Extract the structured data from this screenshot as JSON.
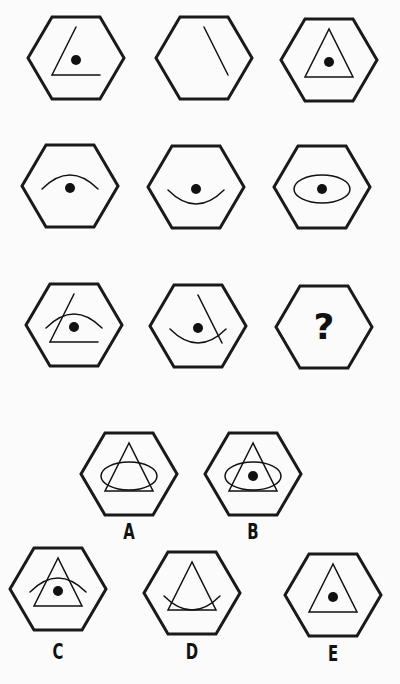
{
  "puzzle": {
    "header_partial_text": "",
    "question_mark": "?",
    "hexagon": {
      "half_width": 48,
      "half_height": 41,
      "stroke": "#1a1a1a",
      "stroke_width": 3
    },
    "colors": {
      "background": "#fbfbfb",
      "ink": "#111111"
    },
    "grid": [
      {
        "id": "r1c1",
        "cx": 76,
        "cy": 58,
        "elements": [
          "left-line",
          "base-line",
          "dot"
        ]
      },
      {
        "id": "r1c2",
        "cx": 204,
        "cy": 58,
        "elements": [
          "right-line"
        ]
      },
      {
        "id": "r1c3",
        "cx": 329,
        "cy": 60,
        "elements": [
          "triangle",
          "dot"
        ]
      },
      {
        "id": "r2c1",
        "cx": 70,
        "cy": 186,
        "elements": [
          "top-arc",
          "dot"
        ]
      },
      {
        "id": "r2c2",
        "cx": 196,
        "cy": 187,
        "elements": [
          "bottom-arc",
          "dot"
        ]
      },
      {
        "id": "r2c3",
        "cx": 322,
        "cy": 187,
        "elements": [
          "ellipse",
          "dot"
        ]
      },
      {
        "id": "r3c1",
        "cx": 74,
        "cy": 325,
        "elements": [
          "left-line",
          "base-line",
          "top-arc",
          "dot"
        ]
      },
      {
        "id": "r3c2",
        "cx": 198,
        "cy": 326,
        "elements": [
          "right-line",
          "bottom-arc",
          "dot"
        ]
      },
      {
        "id": "r3c3",
        "cx": 324,
        "cy": 327,
        "elements": [
          "question-mark"
        ]
      }
    ],
    "options": [
      {
        "label": "A",
        "cx": 129,
        "cy": 474,
        "label_y": 533,
        "elements": [
          "triangle",
          "ellipse"
        ]
      },
      {
        "label": "B",
        "cx": 253,
        "cy": 474,
        "label_y": 533,
        "elements": [
          "triangle",
          "ellipse",
          "dot"
        ]
      },
      {
        "label": "C",
        "cx": 58,
        "cy": 589,
        "label_y": 653,
        "elements": [
          "triangle",
          "top-arc",
          "dot"
        ]
      },
      {
        "label": "D",
        "cx": 192,
        "cy": 593,
        "label_y": 653,
        "elements": [
          "triangle",
          "bottom-arc"
        ]
      },
      {
        "label": "E",
        "cx": 333,
        "cy": 595,
        "label_y": 655,
        "elements": [
          "triangle",
          "dot"
        ]
      }
    ]
  }
}
